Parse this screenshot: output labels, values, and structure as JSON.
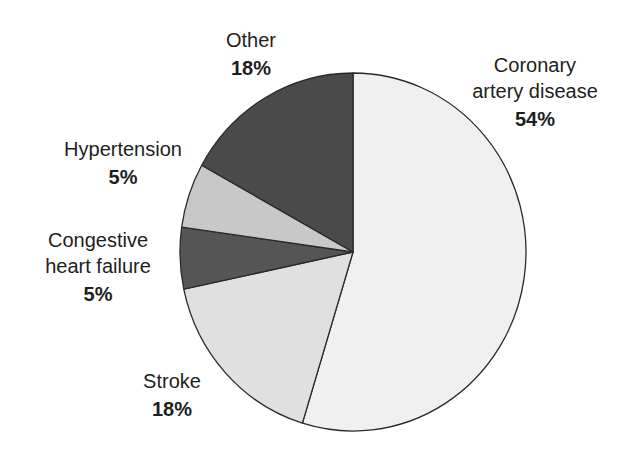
{
  "chart_data": {
    "type": "pie",
    "title": "",
    "slices": [
      {
        "label": "Coronary artery disease",
        "value": 54,
        "display": "54%",
        "color": "#f0f0f0",
        "start_deg": 0,
        "end_deg": 197
      },
      {
        "label": "Stroke",
        "value": 18,
        "display": "18%",
        "color": "#e0e0e0",
        "start_deg": 197,
        "end_deg": 258
      },
      {
        "label": "Congestive heart failure",
        "value": 5,
        "display": "5%",
        "color": "#555555",
        "start_deg": 258,
        "end_deg": 278
      },
      {
        "label": "Hypertension",
        "value": 5,
        "display": "5%",
        "color": "#c8c8c8",
        "start_deg": 278,
        "end_deg": 299
      },
      {
        "label": "Other",
        "value": 18,
        "display": "18%",
        "color": "#4a4a4a",
        "start_deg": 299,
        "end_deg": 360
      }
    ],
    "start_angle": "12 o'clock, clockwise",
    "legend": "none (direct labels)"
  },
  "labels": {
    "cad": {
      "line1": "Coronary",
      "line2": "artery disease",
      "pct": "54%"
    },
    "stroke": {
      "line1": "Stroke",
      "pct": "18%"
    },
    "chf": {
      "line1": "Congestive",
      "line2": "heart failure",
      "pct": "5%"
    },
    "hypertension": {
      "line1": "Hypertension",
      "pct": "5%"
    },
    "other": {
      "line1": "Other",
      "pct": "18%"
    }
  },
  "colors": {
    "outline": "#2a2a2a",
    "background": "#ffffff"
  }
}
